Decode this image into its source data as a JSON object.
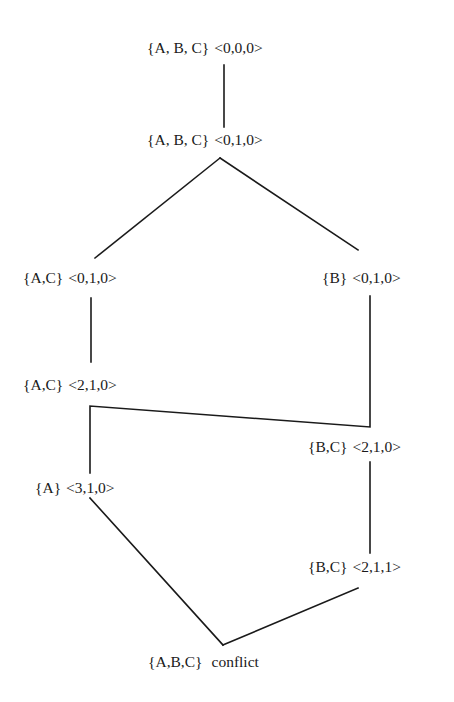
{
  "diagram": {
    "type": "lattice-search-tree",
    "nodes": [
      {
        "id": "n1",
        "set": "{A, B, C}",
        "vector": "<0,0,0>",
        "x": 147,
        "y": 48
      },
      {
        "id": "n2",
        "set": "{A, B, C}",
        "vector": "<0,1,0>",
        "x": 147,
        "y": 140
      },
      {
        "id": "n3",
        "set": "{A,C}",
        "vector": "<0,1,0>",
        "x": 23,
        "y": 278
      },
      {
        "id": "n4",
        "set": "{B}",
        "vector": "<0,1,0>",
        "x": 322,
        "y": 278
      },
      {
        "id": "n5",
        "set": "{A,C}",
        "vector": "<2,1,0>",
        "x": 23,
        "y": 385
      },
      {
        "id": "n6",
        "set": "{B,C}",
        "vector": "<2,1,0>",
        "x": 308,
        "y": 447
      },
      {
        "id": "n7",
        "set": "{A}",
        "vector": "<3,1,0>",
        "x": 35,
        "y": 488
      },
      {
        "id": "n8",
        "set": "{B,C}",
        "vector": "<2,1,1>",
        "x": 308,
        "y": 567
      },
      {
        "id": "n9",
        "set": "{A,B,C}",
        "vector": "conflict",
        "x": 148,
        "y": 662
      }
    ],
    "edges": [
      {
        "from": "n1",
        "to": "n2",
        "points": "224,65 224,127"
      },
      {
        "from": "n2",
        "to": "n3",
        "points": "220,158 95,258"
      },
      {
        "from": "n2",
        "to": "n4",
        "points": "220,158 358,250"
      },
      {
        "from": "n3",
        "to": "n5",
        "points": "91,298 91,362"
      },
      {
        "from": "n4",
        "to": "n6",
        "points": "370,296 370,427 90,406 90,473"
      },
      {
        "from": "n6",
        "to": "n8",
        "points": "370,462 370,553"
      },
      {
        "from": "n7",
        "to": "n9",
        "points": "90,498 223,645"
      },
      {
        "from": "n8",
        "to": "n9",
        "points": "358,588 223,645"
      }
    ]
  }
}
